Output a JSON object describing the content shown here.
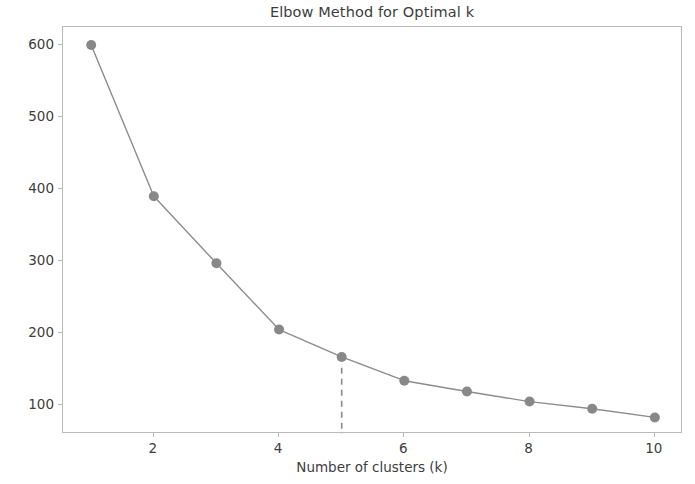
{
  "chart_data": {
    "type": "line",
    "title": "Elbow Method for Optimal k",
    "xlabel": "Number of clusters (k)",
    "ylabel": "Inertia",
    "x": [
      1,
      2,
      3,
      4,
      5,
      6,
      7,
      8,
      9,
      10
    ],
    "values": [
      600,
      390,
      297,
      205,
      167,
      134,
      119,
      105,
      95,
      83
    ],
    "series": [
      {
        "name": "Inertia",
        "values": [
          600,
          390,
          297,
          205,
          167,
          134,
          119,
          105,
          95,
          83
        ]
      }
    ],
    "xlim": [
      0.55,
      10.45
    ],
    "ylim": [
      60,
      625
    ],
    "xticks": [
      2,
      4,
      6,
      8,
      10
    ],
    "xtick_labels": [
      "2",
      "4",
      "6",
      "8",
      "10"
    ],
    "yticks": [
      100,
      200,
      300,
      400,
      500,
      600
    ],
    "ytick_labels": [
      "100",
      "200",
      "300",
      "400",
      "500",
      "600"
    ],
    "grid": false,
    "legend": "none",
    "line_color": "#8c8c8c",
    "marker_color": "#888888",
    "marker": "circle",
    "annotations": [
      {
        "type": "vertical-dashed-line",
        "name": "optimal-k-line",
        "x": 5,
        "y_from": 152,
        "y_to": 60,
        "color": "#8a8a8a",
        "dash": "dashed"
      }
    ],
    "axes_frame_color": "#b9b9b9"
  }
}
